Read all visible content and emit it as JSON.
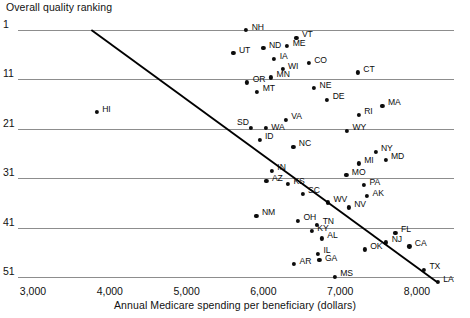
{
  "chart_data": {
    "type": "scatter",
    "title": "",
    "ylabel": "Overall quality ranking",
    "xlabel": "Annual Medicare spending per beneficiary (dollars)",
    "xlim": [
      3000,
      8400
    ],
    "ylim": [
      1,
      53
    ],
    "y_inverted": true,
    "grid": "horizontal",
    "legend": "none",
    "xticks": [
      "3,000",
      "4,000",
      "5,000",
      "6,000",
      "7,000",
      "8,000"
    ],
    "xtick_values": [
      3000,
      4000,
      5000,
      6000,
      7000,
      8000
    ],
    "yticks": [
      "1",
      "11",
      "21",
      "31",
      "41",
      "51"
    ],
    "ytick_values": [
      1,
      11,
      21,
      31,
      41,
      51
    ],
    "trendline": {
      "type": "line",
      "x": [
        3760,
        8260
      ],
      "y": [
        1,
        52
      ],
      "color": "#000000"
    },
    "points": [
      {
        "label": "NH",
        "x": 5770,
        "y": 1.0,
        "lx": 6.0,
        "ly": -3.5
      },
      {
        "label": "VT",
        "x": 6430,
        "y": 2.6,
        "lx": 5.5,
        "ly": -3.5
      },
      {
        "label": "ME",
        "x": 6310,
        "y": 4.3,
        "lx": 5.5,
        "ly": -3.5
      },
      {
        "label": "ND",
        "x": 6000,
        "y": 4.7,
        "lx": 5.5,
        "ly": -3.5
      },
      {
        "label": "UT",
        "x": 5610,
        "y": 5.7,
        "lx": 5.5,
        "ly": -3.5
      },
      {
        "label": "IA",
        "x": 6140,
        "y": 6.9,
        "lx": 5.5,
        "ly": -3.5
      },
      {
        "label": "WI",
        "x": 6250,
        "y": 8.9,
        "lx": 5.5,
        "ly": -3.5
      },
      {
        "label": "CO",
        "x": 6590,
        "y": 7.7,
        "lx": 5.5,
        "ly": -3.5
      },
      {
        "label": "CT",
        "x": 7230,
        "y": 9.6,
        "lx": 5.5,
        "ly": -3.5
      },
      {
        "label": "MN",
        "x": 6100,
        "y": 10.6,
        "lx": 5.5,
        "ly": -3.5
      },
      {
        "label": "OR",
        "x": 5790,
        "y": 11.6,
        "lx": 5.5,
        "ly": -3.5
      },
      {
        "label": "MT",
        "x": 5920,
        "y": 13.5,
        "lx": 5.5,
        "ly": -3.5
      },
      {
        "label": "NE",
        "x": 6660,
        "y": 12.8,
        "lx": 5.5,
        "ly": -3.5
      },
      {
        "label": "DE",
        "x": 6830,
        "y": 15.1,
        "lx": 5.5,
        "ly": -3.5
      },
      {
        "label": "HI",
        "x": 3830,
        "y": 17.6,
        "lx": 5.5,
        "ly": -3.5
      },
      {
        "label": "MA",
        "x": 7550,
        "y": 16.3,
        "lx": 5.5,
        "ly": -3.5
      },
      {
        "label": "RI",
        "x": 7240,
        "y": 18.2,
        "lx": 5.5,
        "ly": -3.5
      },
      {
        "label": "VA",
        "x": 6290,
        "y": 19.2,
        "lx": 5.5,
        "ly": -3.5
      },
      {
        "label": "SD",
        "x": 5840,
        "y": 20.8,
        "lx": -14.0,
        "ly": -5.5
      },
      {
        "label": "WA",
        "x": 6030,
        "y": 20.9,
        "lx": 5.5,
        "ly": -1.5
      },
      {
        "label": "WY",
        "x": 7090,
        "y": 21.4,
        "lx": 5.5,
        "ly": -3.5
      },
      {
        "label": "ID",
        "x": 5950,
        "y": 23.2,
        "lx": 5.5,
        "ly": -3.5
      },
      {
        "label": "NC",
        "x": 6390,
        "y": 24.6,
        "lx": 5.5,
        "ly": -3.5
      },
      {
        "label": "NY",
        "x": 7460,
        "y": 25.6,
        "lx": 5.5,
        "ly": -3.5
      },
      {
        "label": "MD",
        "x": 7590,
        "y": 27.3,
        "lx": 5.5,
        "ly": -3.5
      },
      {
        "label": "MI",
        "x": 7240,
        "y": 28.0,
        "lx": 5.5,
        "ly": -3.5
      },
      {
        "label": "IN",
        "x": 6110,
        "y": 29.5,
        "lx": 5.5,
        "ly": -3.5
      },
      {
        "label": "MO",
        "x": 7080,
        "y": 30.4,
        "lx": 5.5,
        "ly": -3.5
      },
      {
        "label": "AZ",
        "x": 6040,
        "y": 31.6,
        "lx": 5.5,
        "ly": -3.5
      },
      {
        "label": "KS",
        "x": 6320,
        "y": 32.2,
        "lx": 5.5,
        "ly": -3.5
      },
      {
        "label": "PA",
        "x": 7310,
        "y": 32.4,
        "lx": 5.5,
        "ly": -3.5
      },
      {
        "label": "SC",
        "x": 6510,
        "y": 34.1,
        "lx": 5.5,
        "ly": -3.5
      },
      {
        "label": "AK",
        "x": 7350,
        "y": 34.6,
        "lx": 5.5,
        "ly": -2.5
      },
      {
        "label": "WV",
        "x": 6840,
        "y": 35.9,
        "lx": 5.5,
        "ly": -3.5
      },
      {
        "label": "NV",
        "x": 7110,
        "y": 36.9,
        "lx": 5.5,
        "ly": -3.5
      },
      {
        "label": "NM",
        "x": 5910,
        "y": 38.6,
        "lx": 5.5,
        "ly": -3.5
      },
      {
        "label": "OH",
        "x": 6450,
        "y": 39.6,
        "lx": 5.5,
        "ly": -3.5
      },
      {
        "label": "TN",
        "x": 6700,
        "y": 40.4,
        "lx": 5.5,
        "ly": -3.5
      },
      {
        "label": "KY",
        "x": 6630,
        "y": 41.7,
        "lx": 5.5,
        "ly": -3.5
      },
      {
        "label": "FL",
        "x": 7720,
        "y": 42.0,
        "lx": 5.5,
        "ly": -3.5
      },
      {
        "label": "AL",
        "x": 6760,
        "y": 43.2,
        "lx": 5.5,
        "ly": -3.5
      },
      {
        "label": "NJ",
        "x": 7600,
        "y": 44.0,
        "lx": 5.5,
        "ly": -3.5
      },
      {
        "label": "CA",
        "x": 7900,
        "y": 44.8,
        "lx": 5.5,
        "ly": -3.5
      },
      {
        "label": "OK",
        "x": 7320,
        "y": 45.4,
        "lx": 5.5,
        "ly": -3.5
      },
      {
        "label": "IL",
        "x": 6710,
        "y": 46.3,
        "lx": 5.5,
        "ly": -3.5
      },
      {
        "label": "GA",
        "x": 6730,
        "y": 47.6,
        "lx": 5.5,
        "ly": -2.0
      },
      {
        "label": "AR",
        "x": 6400,
        "y": 48.4,
        "lx": 5.5,
        "ly": -3.5
      },
      {
        "label": "TX",
        "x": 8090,
        "y": 49.5,
        "lx": 5.5,
        "ly": -3.5
      },
      {
        "label": "MS",
        "x": 6930,
        "y": 50.9,
        "lx": 5.5,
        "ly": -3.5
      },
      {
        "label": "LA",
        "x": 8270,
        "y": 52.0,
        "lx": 5.5,
        "ly": -2.5
      }
    ]
  }
}
